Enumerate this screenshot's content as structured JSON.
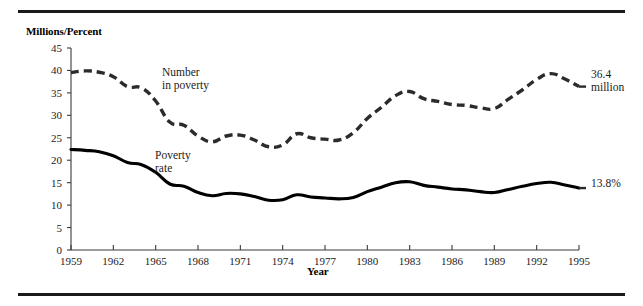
{
  "figure": {
    "y_axis_title": "Millions/Percent",
    "x_axis_title": "Year",
    "top_rule": true,
    "bottom_rule": true
  },
  "annotations": {
    "number_in_poverty_label_line1": "Number",
    "number_in_poverty_label_line2": "in poverty",
    "poverty_rate_label_line1": "Poverty",
    "poverty_rate_label_line2": "rate",
    "number_end_label_line1": "36.4",
    "number_end_label_line2": "million",
    "rate_end_label": "13.8%"
  },
  "chart_data": {
    "type": "line",
    "title": "",
    "xlabel": "Year",
    "ylabel": "Millions/Percent",
    "xlim": [
      1959,
      1995
    ],
    "ylim": [
      0,
      45
    ],
    "ytick_step": 5,
    "yticks": [
      0,
      5,
      10,
      15,
      20,
      25,
      30,
      35,
      40,
      45
    ],
    "xticks": [
      1959,
      1962,
      1965,
      1968,
      1971,
      1974,
      1977,
      1980,
      1983,
      1986,
      1989,
      1992,
      1995
    ],
    "grid": false,
    "legend": "inline-annotations",
    "x": [
      1959,
      1960,
      1961,
      1962,
      1963,
      1964,
      1965,
      1966,
      1967,
      1968,
      1969,
      1970,
      1971,
      1972,
      1973,
      1974,
      1975,
      1976,
      1977,
      1978,
      1979,
      1980,
      1981,
      1982,
      1983,
      1984,
      1985,
      1986,
      1987,
      1988,
      1989,
      1990,
      1991,
      1992,
      1993,
      1994,
      1995
    ],
    "series": [
      {
        "name": "Number in poverty",
        "units": "millions",
        "style": "dashed",
        "color": "#2b2b2b",
        "end_value": 36.4,
        "values": [
          39.5,
          39.9,
          39.6,
          38.6,
          36.4,
          36.1,
          33.2,
          28.5,
          27.8,
          25.4,
          24.1,
          25.4,
          25.6,
          24.5,
          23.0,
          23.4,
          25.9,
          25.0,
          24.7,
          24.5,
          26.1,
          29.3,
          31.8,
          34.4,
          35.3,
          33.7,
          33.1,
          32.4,
          32.2,
          31.7,
          31.5,
          33.6,
          35.7,
          38.0,
          39.3,
          38.1,
          36.4
        ]
      },
      {
        "name": "Poverty rate",
        "units": "percent",
        "style": "solid",
        "color": "#000000",
        "end_value": 13.8,
        "values": [
          22.4,
          22.2,
          21.9,
          21.0,
          19.5,
          19.0,
          17.3,
          14.7,
          14.2,
          12.8,
          12.1,
          12.6,
          12.5,
          11.9,
          11.1,
          11.2,
          12.3,
          11.8,
          11.6,
          11.4,
          11.7,
          13.0,
          14.0,
          15.0,
          15.2,
          14.4,
          14.0,
          13.6,
          13.4,
          13.0,
          12.8,
          13.5,
          14.2,
          14.8,
          15.1,
          14.5,
          13.8
        ]
      }
    ]
  }
}
